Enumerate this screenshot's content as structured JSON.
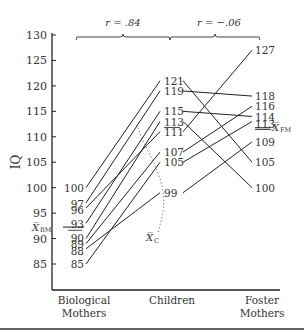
{
  "chart_data": {
    "type": "line",
    "title": "",
    "ylabel": "IQ",
    "xlabel": "",
    "ylim": [
      85,
      130
    ],
    "yticks": [
      85,
      90,
      95,
      100,
      105,
      110,
      115,
      120,
      125,
      130
    ],
    "categories": [
      "Biological Mothers",
      "Children",
      "Foster Mothers"
    ],
    "category_labels": [
      [
        "Biological",
        "Mothers"
      ],
      [
        "Children"
      ],
      [
        "Foster",
        "Mothers"
      ]
    ],
    "correlations": [
      {
        "label": "r = .84",
        "between": [
          "Biological Mothers",
          "Children"
        ]
      },
      {
        "label": "r = −.06",
        "between": [
          "Children",
          "Foster Mothers"
        ]
      }
    ],
    "triples": [
      {
        "biological": 100,
        "child": 121,
        "foster": 105
      },
      {
        "biological": 97,
        "child": 119,
        "foster": 118
      },
      {
        "biological": 93,
        "child": 115,
        "foster": 114
      },
      {
        "biological": 90,
        "child": 113,
        "foster": 100
      },
      {
        "biological": 96,
        "child": 111,
        "foster": 127
      },
      {
        "biological": 89,
        "child": 107,
        "foster": 116
      },
      {
        "biological": 85,
        "child": 105,
        "foster": 113
      },
      {
        "biological": 88,
        "child": 99,
        "foster": 109
      }
    ],
    "biological_labels": [
      "100",
      "97",
      "96",
      "93",
      "90",
      "89",
      "88",
      "85"
    ],
    "child_labels": [
      "121",
      "119",
      "115",
      "113",
      "111",
      "107",
      "105",
      "99"
    ],
    "foster_labels": [
      "127",
      "118",
      "116",
      "114",
      "113",
      "109",
      "105",
      "100"
    ],
    "means": {
      "biological": {
        "label": "X̅BM",
        "value": 92.25
      },
      "child": {
        "label": "X̅C",
        "value": 111.25
      },
      "foster": {
        "label": "X̅FM",
        "value": 112.75
      }
    },
    "annotations": [
      "X̅BM",
      "X̅C",
      "X̅FM"
    ]
  }
}
